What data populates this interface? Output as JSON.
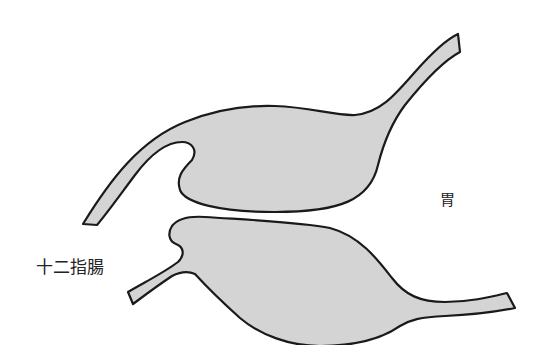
{
  "diagram": {
    "labels": {
      "duodenum": "十二指腸",
      "stomach": "胃"
    },
    "colors": {
      "fill": "#d4d4d4",
      "stroke": "#1a1a1a",
      "background": "#ffffff",
      "text": "#222222"
    }
  }
}
